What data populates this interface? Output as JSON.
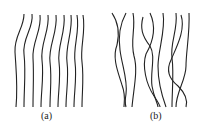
{
  "panels": [
    {
      "id": "a",
      "label": "(a)",
      "description": "parallel wavy fibers"
    },
    {
      "id": "b",
      "label": "(b)",
      "description": "entangled crossing fibers"
    }
  ],
  "colors": {
    "line": "#222222",
    "background": "#ffffff"
  }
}
